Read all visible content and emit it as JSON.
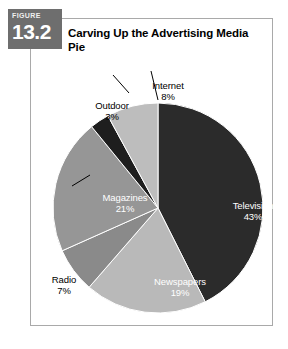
{
  "figure": {
    "tab_word": "FIGURE",
    "number": "13.2",
    "title": "Carving Up the Advertising Media Pie"
  },
  "colors": {
    "tab_background": "#6e6e6e",
    "panel_border": "#a9a9a9",
    "panel_background": "#ffffff",
    "slice_television": "#2b2b2b",
    "slice_newspapers": "#b9b9b9",
    "slice_radio": "#8a8a8a",
    "slice_magazines": "#969696",
    "slice_outdoor": "#1e1e1e",
    "slice_internet": "#bdbdbd",
    "label_inside": "#ffffff",
    "label_outside": "#000000",
    "leader_line": "#000000"
  },
  "chart_data": {
    "type": "pie",
    "title": "Carving Up the Advertising Media Pie",
    "categories": [
      "Television",
      "Newspapers",
      "Radio",
      "Magazines",
      "Outdoor",
      "Internet"
    ],
    "values": [
      43,
      19,
      7,
      21,
      3,
      8
    ],
    "unit": "%",
    "start_angle_deg": 0,
    "direction": "clockwise",
    "legend": "none",
    "grid": false,
    "slices": [
      {
        "name": "Television",
        "value": 43,
        "value_label": "43%",
        "color": "#2b2b2b",
        "label_position": "inside",
        "label_color": "#ffffff"
      },
      {
        "name": "Newspapers",
        "value": 19,
        "value_label": "19%",
        "color": "#b9b9b9",
        "label_position": "inside",
        "label_color": "#ffffff"
      },
      {
        "name": "Radio",
        "value": 7,
        "value_label": "7%",
        "color": "#8a8a8a",
        "label_position": "outside",
        "label_color": "#000000"
      },
      {
        "name": "Magazines",
        "value": 21,
        "value_label": "21%",
        "color": "#969696",
        "label_position": "inside",
        "label_color": "#ffffff"
      },
      {
        "name": "Outdoor",
        "value": 3,
        "value_label": "3%",
        "color": "#1e1e1e",
        "label_position": "outside",
        "label_color": "#000000"
      },
      {
        "name": "Internet",
        "value": 8,
        "value_label": "8%",
        "color": "#bdbdbd",
        "label_position": "outside",
        "label_color": "#000000"
      }
    ]
  },
  "labels": {
    "television": {
      "name": "Television",
      "pct": "43%"
    },
    "newspapers": {
      "name": "Newspapers",
      "pct": "19%"
    },
    "radio": {
      "name": "Radio",
      "pct": "7%"
    },
    "magazines": {
      "name": "Magazines",
      "pct": "21%"
    },
    "outdoor": {
      "name": "Outdoor",
      "pct": "3%"
    },
    "internet": {
      "name": "Internet",
      "pct": "8%"
    }
  }
}
